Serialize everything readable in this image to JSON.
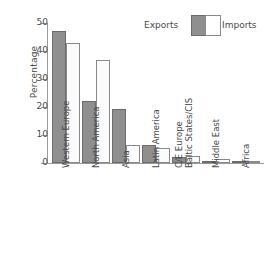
{
  "chart_data": {
    "type": "bar",
    "title": "",
    "xlabel": "",
    "ylabel": "Percentage",
    "ylim": [
      0,
      50
    ],
    "yticks": [
      0,
      10,
      20,
      30,
      40,
      50
    ],
    "grid": false,
    "legend_position": "top-right",
    "categories": [
      "Western Europe",
      "North America",
      "Asia",
      "Latin America",
      "C/E Europe\nBaltic States/CIS",
      "Middle East",
      "Africa"
    ],
    "series": [
      {
        "name": "Exports",
        "color": "#8f8f8f",
        "values": [
          47,
          22,
          19.3,
          6.6,
          2.3,
          0.2,
          0.1
        ]
      },
      {
        "name": "Imports",
        "color": "#ffffff",
        "values": [
          42.8,
          36.7,
          6.5,
          5.2,
          2.4,
          1.6,
          0.8
        ]
      }
    ]
  },
  "legend": {
    "exports_label": "Exports",
    "imports_label": "Imports"
  },
  "axis": {
    "y_title": "Percentage",
    "tick_50": "50",
    "tick_40": "40",
    "tick_30": "30",
    "tick_20": "20",
    "tick_10": "10",
    "tick_0": "0"
  },
  "xlabels": {
    "l0": "Western Europe",
    "l1": "North America",
    "l2": "Asia",
    "l3": "Latin America",
    "l4a": "C/E Europe",
    "l4b": "Baltic States/CIS",
    "l5": "Middle East",
    "l6": "Africa"
  }
}
